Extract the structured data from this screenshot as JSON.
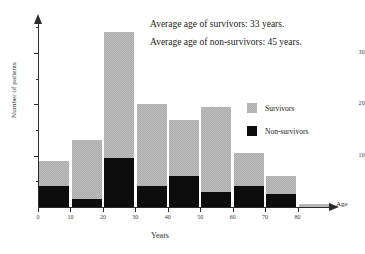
{
  "chart_data": {
    "type": "bar",
    "stacked": true,
    "title": "",
    "xlabel": "Years",
    "ylabel": "Number of patients",
    "axis_end_label": "Age",
    "categories": [
      "0-10",
      "10-20",
      "20-30",
      "30-40",
      "40-50",
      "50-60",
      "60-70",
      "70-80",
      "80-90"
    ],
    "bin_starts": [
      0,
      10,
      20,
      30,
      40,
      50,
      60,
      70,
      80
    ],
    "bin_width": 10,
    "xlim": [
      0,
      90
    ],
    "ylim": [
      0,
      36
    ],
    "grid": false,
    "xticks": [
      "0",
      "10",
      "20",
      "30",
      "40",
      "50",
      "60",
      "70",
      "80"
    ],
    "xtick_values": [
      0,
      10,
      20,
      30,
      40,
      50,
      60,
      70,
      80
    ],
    "yticks": [
      "10",
      "20",
      "30"
    ],
    "ytick_values": [
      10,
      20,
      30
    ],
    "yminor_values": [
      5,
      15,
      25,
      35
    ],
    "legend_position": "right",
    "series": [
      {
        "name": "Non-survivors",
        "color": "#0d0d0d",
        "values": [
          4,
          1.5,
          9.5,
          4,
          6,
          3,
          4,
          2.5,
          0
        ]
      },
      {
        "name": "Survivors",
        "color": "#bdbdbd",
        "values": [
          5,
          11.5,
          24.5,
          16,
          11,
          16.5,
          6.5,
          3.5,
          0.5
        ]
      }
    ],
    "totals": [
      9,
      13,
      34,
      20,
      17,
      19.5,
      10.5,
      6,
      0.5
    ],
    "annotations": [
      "Average age of survivors: 33 years.",
      "Average age of non-survivors: 45 years."
    ]
  },
  "legend": {
    "items": [
      {
        "label": "Survivors",
        "swatch": "survivors-swatch"
      },
      {
        "label": "Non-survivors",
        "swatch": "non-survivors-swatch"
      }
    ]
  },
  "annotations": {
    "line1": "Average age of survivors: 33 years.",
    "line2": "Average age of non-survivors: 45 years."
  },
  "axes": {
    "y_title": "Number of patients",
    "x_title": "Years",
    "x_end": "Age"
  }
}
